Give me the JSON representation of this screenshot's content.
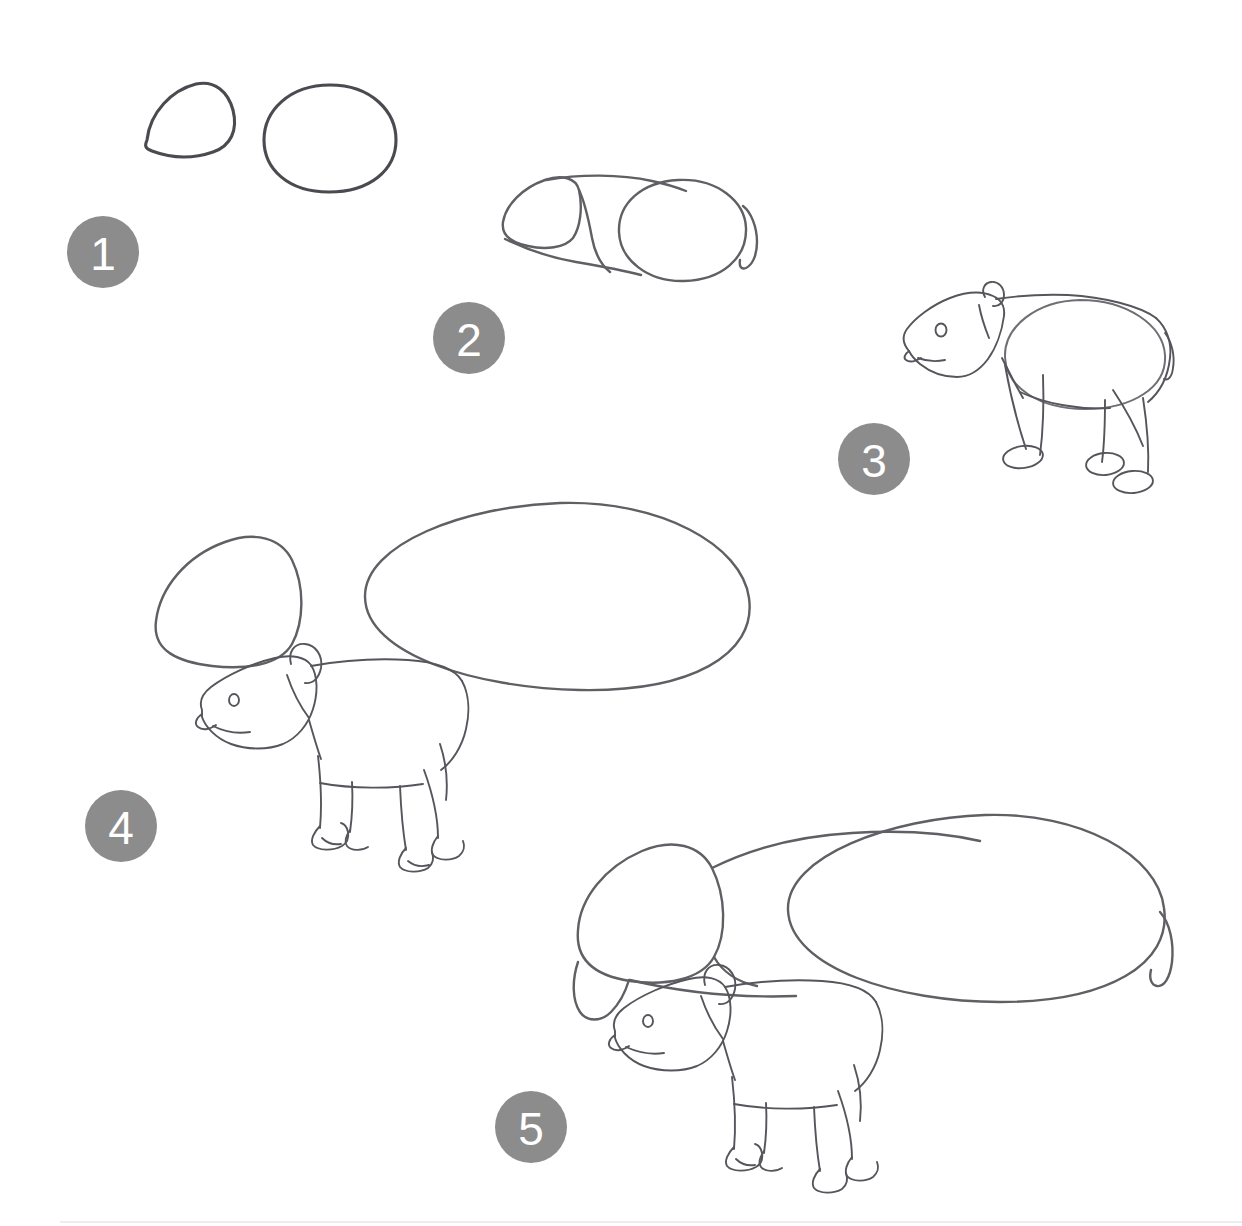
{
  "tutorial": {
    "title": "How to Draw a Tapir",
    "subject": "tapir",
    "style": "pencil line drawing",
    "background_color": "#ffffff",
    "stroke_color": "#5f5f64",
    "badge_color": "#8c8c8c",
    "badge_text_color": "#ffffff",
    "step_count": 5,
    "steps": [
      {
        "number": "1",
        "label": "Step 1",
        "description": "Draw a rounded triangular head shape and a large oval body shape",
        "badge_x": 103,
        "badge_y": 252,
        "shapes": [
          "head-guide-triangle",
          "body-guide-oval"
        ]
      },
      {
        "number": "2",
        "label": "Step 2",
        "description": "Connect the head and body with neck and back lines, add a small tail hook",
        "badge_x": 469,
        "badge_y": 338,
        "shapes": [
          "head-guide-triangle",
          "body-guide-oval",
          "neck-connector",
          "back-line",
          "belly-line",
          "tail-hook"
        ]
      },
      {
        "number": "3",
        "label": "Step 3",
        "description": "Sketch the head details, ear, eye, snout and four legs with oval feet",
        "badge_x": 874,
        "badge_y": 459,
        "shapes": [
          "tapir-rough-sketch",
          "body-guide-oval",
          "legs",
          "oval-feet",
          "ear",
          "eye",
          "snout",
          "tail-hook"
        ]
      },
      {
        "number": "4",
        "label": "Step 4",
        "description": "Refine the baby tapir outline with toed feet in front of the adult guide shapes",
        "badge_x": 121,
        "badge_y": 826,
        "shapes": [
          "adult-head-guide-triangle",
          "adult-body-guide-oval",
          "baby-tapir-refined",
          "toed-feet"
        ]
      },
      {
        "number": "5",
        "label": "Step 5",
        "description": "Connect the adult head and body guides with neck, back and tail lines over the finished baby tapir",
        "badge_x": 531,
        "badge_y": 1127,
        "shapes": [
          "adult-head-guide-triangle",
          "adult-body-guide-oval",
          "adult-neck-connector",
          "adult-back-line",
          "adult-belly-line",
          "adult-tail-hook",
          "baby-tapir-refined"
        ]
      }
    ]
  }
}
